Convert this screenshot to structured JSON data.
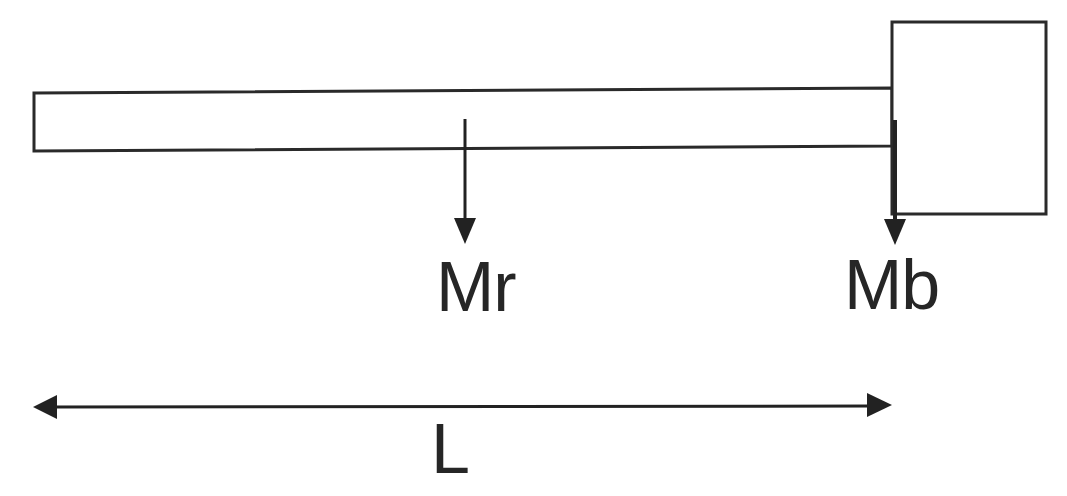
{
  "diagram": {
    "title": "",
    "labels": {
      "rod_mass": "Mr",
      "block_mass": "Mb",
      "length": "L"
    },
    "elements": {
      "rod": {
        "description": "thin horizontal rod (beam)"
      },
      "block": {
        "description": "rectangular block attached to right end of rod"
      },
      "rod_force_arrow": {
        "description": "downward arrow at rod midpoint",
        "label": "Mr"
      },
      "block_force_arrow": {
        "description": "downward arrow at rod-block junction",
        "label": "Mb"
      },
      "length_dimension": {
        "description": "double-headed horizontal arrow spanning rod length",
        "label": "L"
      }
    },
    "colors": {
      "stroke": "#2a2a2a",
      "text": "#262626",
      "background": "#ffffff"
    }
  }
}
